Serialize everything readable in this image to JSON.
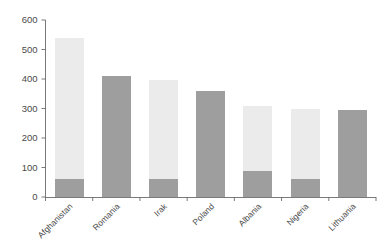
{
  "chart_data": {
    "type": "bar",
    "subtype": "stacked-bar",
    "title": "",
    "subtitle": "",
    "xlabel": "",
    "ylabel": "",
    "categories": [
      "Afghanistan",
      "Romania",
      "Irak",
      "Poland",
      "Albania",
      "Nigeria",
      "Lithuania"
    ],
    "series": [
      {
        "name": "lower",
        "color": "#9e9e9e",
        "values": [
          60,
          410,
          60,
          360,
          88,
          60,
          295
        ]
      },
      {
        "name": "upper",
        "color": "#ebebeb",
        "values": [
          480,
          0,
          338,
          0,
          220,
          240,
          0
        ]
      }
    ],
    "totals": [
      540,
      410,
      398,
      360,
      308,
      300,
      295
    ],
    "ylim": [
      0,
      600
    ],
    "yticks": [
      0,
      100,
      200,
      300,
      400,
      500,
      600
    ],
    "ytick_labels": [
      "0",
      "100",
      "200",
      "300",
      "400",
      "500",
      "600"
    ],
    "grid": false,
    "legend": "none",
    "annotations": []
  },
  "colors": {
    "bar_light": "#ebebeb",
    "bar_dark": "#9e9e9e",
    "axis": "#6b6b6b",
    "text": "#4a4a4a",
    "background": "#ffffff"
  }
}
